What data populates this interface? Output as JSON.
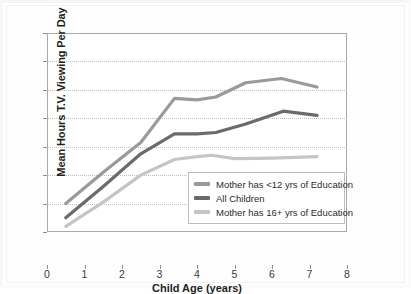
{
  "chart_data": {
    "type": "line",
    "title": "",
    "xlabel": "Child Age (years)",
    "ylabel": "Mean Hours T.V. Viewing Per Day",
    "xlim": [
      0,
      8
    ],
    "ylim": [
      0,
      7
    ],
    "xticks": [
      "0",
      "1",
      "2",
      "3",
      "4",
      "5",
      "6",
      "7",
      "8"
    ],
    "yticks": [
      "0",
      "1",
      "2",
      "3",
      "4",
      "5",
      "6",
      "7"
    ],
    "grid": "horizontal-dotted",
    "legend_position": "lower-right-inside",
    "series": [
      {
        "name": "Mother has <12 yrs of Education",
        "color": "#9a9a9a",
        "x": [
          0.5,
          1.5,
          2.5,
          3.4,
          4.0,
          4.5,
          5.3,
          6.25,
          7.2
        ],
        "values": [
          1.0,
          2.1,
          3.15,
          4.7,
          4.65,
          4.75,
          5.25,
          5.4,
          5.1
        ]
      },
      {
        "name": "All Children",
        "color": "#6b6b6b",
        "x": [
          0.5,
          1.5,
          2.5,
          3.4,
          4.0,
          4.5,
          5.3,
          6.3,
          7.2
        ],
        "values": [
          0.5,
          1.6,
          2.75,
          3.45,
          3.45,
          3.5,
          3.8,
          4.25,
          4.1
        ]
      },
      {
        "name": "Mother has 16+ yrs of Education",
        "color": "#c5c5c5",
        "x": [
          0.5,
          1.5,
          2.5,
          3.4,
          4.0,
          4.4,
          5.0,
          6.0,
          7.2
        ],
        "values": [
          0.2,
          1.05,
          2.0,
          2.55,
          2.65,
          2.7,
          2.58,
          2.6,
          2.65
        ]
      }
    ]
  },
  "legend": {
    "items": [
      {
        "label": "Mother has <12 yrs of Education",
        "color": "#9a9a9a"
      },
      {
        "label": "All Children",
        "color": "#6b6b6b"
      },
      {
        "label": "Mother has 16+ yrs of Education",
        "color": "#c5c5c5"
      }
    ]
  },
  "axes": {
    "y_title": "Mean Hours T.V. Viewing Per Day",
    "x_title": "Child Age (years)"
  }
}
